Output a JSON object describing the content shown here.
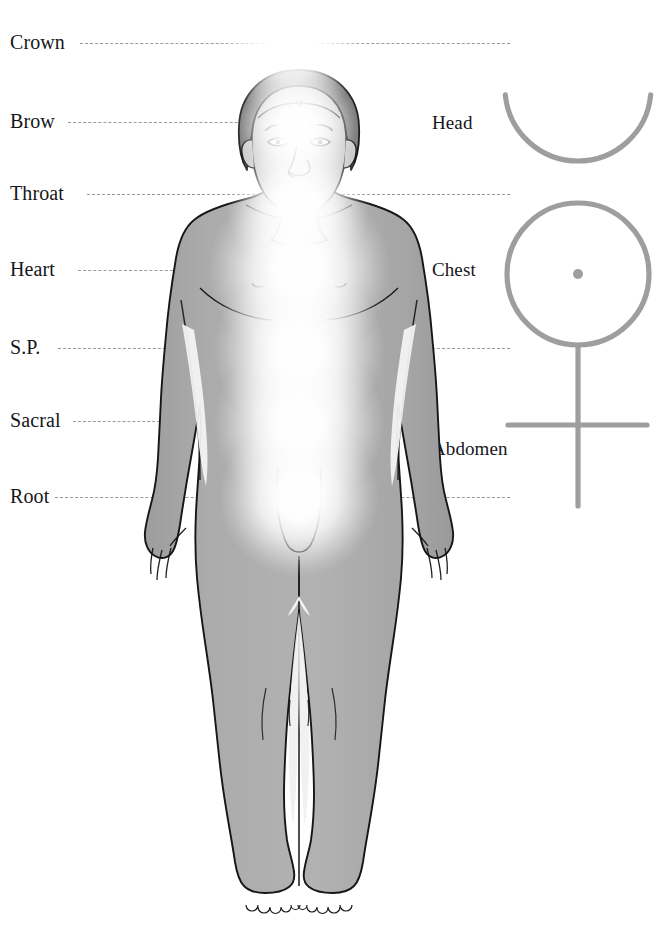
{
  "diagram": {
    "background_color": "#ffffff",
    "body_fill": "#a8a8a8",
    "outline_color": "#16161a",
    "dash_color": "#9a9a9a",
    "symbol_color": "#9e9e9e",
    "glow_color": "#ffffff"
  },
  "left_labels": [
    {
      "text": "Crown",
      "y": 43,
      "dash_start": 80,
      "dash_end": 510,
      "full_width": true
    },
    {
      "text": "Brow",
      "y": 122,
      "dash_start": 68,
      "dash_end": 258,
      "full_width": false
    },
    {
      "text": "Throat",
      "y": 194,
      "dash_start": 87,
      "dash_end": 510,
      "full_width": true
    },
    {
      "text": "Heart",
      "y": 270,
      "dash_start": 78,
      "dash_end": 178,
      "full_width": false
    },
    {
      "text": "S.P.",
      "y": 348,
      "dash_start": 58,
      "dash_end": 510,
      "full_width": true
    },
    {
      "text": "Sacral",
      "y": 421,
      "dash_start": 73,
      "dash_end": 175,
      "full_width": false
    },
    {
      "text": "Root",
      "y": 497,
      "dash_start": 55,
      "dash_end": 510,
      "full_width": true
    }
  ],
  "right_labels": [
    {
      "text": "Head",
      "x": 432,
      "y": 124
    },
    {
      "text": "Chest",
      "x": 432,
      "y": 271
    },
    {
      "text": "Abdomen",
      "x": 432,
      "y": 450
    }
  ],
  "chakra_points": [
    {
      "name": "Crown",
      "cx": 291,
      "cy": 41,
      "r": 40
    },
    {
      "name": "Brow",
      "cx": 297,
      "cy": 126,
      "r": 34
    },
    {
      "name": "Throat",
      "cx": 298,
      "cy": 204,
      "r": 38
    },
    {
      "name": "Heart",
      "cx": 299,
      "cy": 270,
      "r": 48
    },
    {
      "name": "S.P.",
      "cx": 299,
      "cy": 350,
      "r": 45
    },
    {
      "name": "Sacral",
      "cx": 299,
      "cy": 424,
      "r": 45
    },
    {
      "name": "Root",
      "cx": 299,
      "cy": 497,
      "r": 42
    }
  ],
  "symbol": {
    "name": "crescent-circle-cross-symbol",
    "crescent": {
      "cx": 578,
      "cy": 88,
      "r": 73,
      "bottom_y": 198
    },
    "circle": {
      "cx": 578,
      "cy": 274,
      "r": 71
    },
    "center_dot": {
      "cx": 578,
      "cy": 274,
      "r": 5
    },
    "stem": {
      "x": 578,
      "y1": 348,
      "y2": 506
    },
    "crossbar": {
      "y": 425,
      "x1": 508,
      "x2": 647
    }
  }
}
